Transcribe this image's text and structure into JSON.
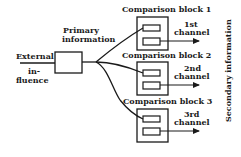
{
  "diagram": {
    "input_label_line1": "External",
    "input_label_line2": "in-",
    "input_label_line3": "fluence",
    "primary_label_line1": "Primary",
    "primary_label_line2": "information",
    "side_label": "Secondary information",
    "blocks": [
      {
        "title": "Comparison block 1",
        "channel_line1": "1st",
        "channel_line2": "channel"
      },
      {
        "title": "Comparison block 2",
        "channel_line1": "2nd",
        "channel_line2": "channel"
      },
      {
        "title": "Comparison block 3",
        "channel_line1": "3rd",
        "channel_line2": "channel"
      }
    ],
    "colors": {
      "ink": "#1a1a1a",
      "background": "#ffffff"
    }
  }
}
